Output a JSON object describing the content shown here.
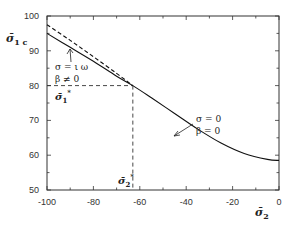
{
  "chart_data": {
    "type": "line",
    "title": "",
    "xlabel": "σ̄₂",
    "ylabel": "σ̄₁c",
    "xlim": [
      -100,
      0
    ],
    "ylim": [
      50,
      100
    ],
    "xticks": [
      -100,
      -80,
      -60,
      -40,
      -20,
      0
    ],
    "yticks": [
      50,
      60,
      70,
      80,
      90,
      100
    ],
    "xtick_labels": [
      "-100",
      "-80",
      "-60",
      "-40",
      "-20",
      "0"
    ],
    "ytick_labels": [
      "50",
      "60",
      "70",
      "80",
      "90",
      "100"
    ],
    "grid": false,
    "series": [
      {
        "name": "σ = 0, β = 0",
        "style": "solid",
        "x": [
          -100,
          -90,
          -80,
          -70,
          -63,
          -55,
          -45,
          -35,
          -25,
          -15,
          -5,
          0
        ],
        "y": [
          95,
          91,
          87,
          82.7,
          80,
          76.5,
          72,
          67.5,
          63.5,
          60.5,
          58.8,
          58.5
        ]
      },
      {
        "name": "σ = iω, β ≠ 0",
        "style": "dashed",
        "x": [
          -100,
          -90,
          -80,
          -70,
          -63
        ],
        "y": [
          97.5,
          93,
          88.3,
          83.5,
          80
        ]
      }
    ],
    "annotations": [
      {
        "text": "σ = ι ω",
        "line2": "β ≠ 0",
        "points_to": "dashed curve near x=-86"
      },
      {
        "text": "σ = 0",
        "line2": "β = 0",
        "points_to": "solid curve near x=-45"
      },
      {
        "text": "σ̄₁*",
        "value_y": 80,
        "note": "dashed horizontal reference"
      },
      {
        "text": "σ̄₂*",
        "value_x": -63,
        "note": "dashed vertical reference"
      }
    ],
    "reference_lines": {
      "x_star": -63,
      "y_star": 80
    }
  },
  "labels": {
    "y_axis_main": "σ̄",
    "y_axis_sub": "1 c",
    "x_axis_main": "σ̄",
    "x_axis_sub": "2",
    "annot1_line1": "σ = ι ω",
    "annot1_line2": "β ≠ 0",
    "annot2_line1": "σ = 0",
    "annot2_line2": "β = 0",
    "s1star_main": "σ̄",
    "s1star_sub": "1",
    "s1star_sup": "*",
    "s2star_main": "σ̄",
    "s2star_sub": "2",
    "s2star_sup": "*"
  }
}
